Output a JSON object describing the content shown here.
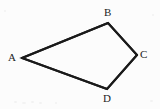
{
  "figure": {
    "kind": "geometry-diagram",
    "shape": "quadrilateral",
    "background_color": "#fcfcfc",
    "stroke_color": "#1a1a1a",
    "stroke_width": 2,
    "label_color": "#1c1c1c",
    "label_font_size": 11,
    "width": 160,
    "height": 109,
    "vertices": [
      {
        "id": "A",
        "label": "A",
        "x": 22,
        "y": 58,
        "label_x": 12,
        "label_y": 57
      },
      {
        "id": "B",
        "label": "B",
        "x": 108,
        "y": 23,
        "label_x": 108,
        "label_y": 12
      },
      {
        "id": "C",
        "label": "C",
        "x": 137,
        "y": 55,
        "label_x": 144,
        "label_y": 54
      },
      {
        "id": "D",
        "label": "D",
        "x": 107,
        "y": 89,
        "label_x": 107,
        "label_y": 98
      }
    ],
    "edges": [
      {
        "id": "AB",
        "from": "A",
        "to": "B"
      },
      {
        "id": "BC",
        "from": "B",
        "to": "C"
      },
      {
        "id": "CD",
        "from": "C",
        "to": "D"
      },
      {
        "id": "DA",
        "from": "D",
        "to": "A"
      }
    ],
    "polygon_points": "22,58 108,23 137,55 107,89"
  }
}
